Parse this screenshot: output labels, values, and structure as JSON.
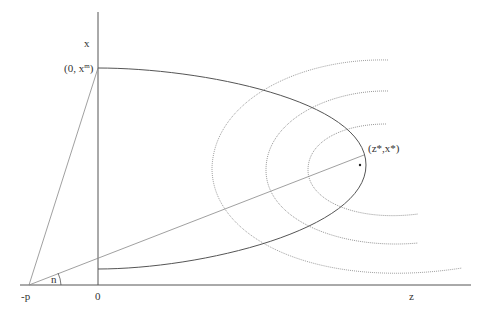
{
  "diagram": {
    "axes": {
      "x_axis_label": "z",
      "y_axis_label": "x",
      "origin_label": "0",
      "neg_point_label": "-p"
    },
    "points": {
      "top_intercept": {
        "prefix": "(0, x",
        "sup": "m",
        "suffix": ")"
      },
      "star_point": "(z*,x*)"
    },
    "angle_label": "n",
    "colors": {
      "axis": "#555555",
      "curve": "#555555",
      "ray": "#888888",
      "dotted_arcs": "#999999",
      "text": "#333333"
    }
  }
}
